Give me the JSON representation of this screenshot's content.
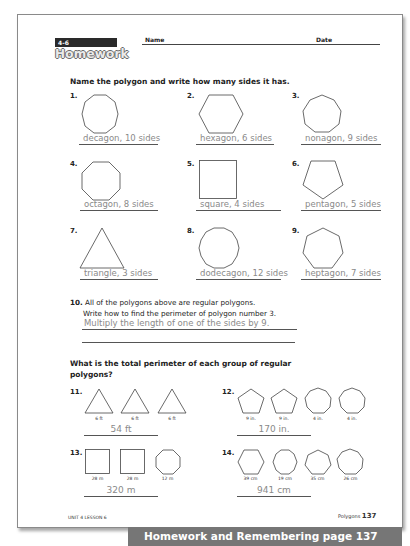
{
  "header": {
    "lesson_number": "4-6",
    "title": "Homework",
    "name_label": "Name",
    "date_label": "Date"
  },
  "instructions": "Name the polygon and write how many sides it has.",
  "polygons": [
    {
      "number": "1.",
      "shape": "decagon",
      "answer": "decagon, 10 sides"
    },
    {
      "number": "2.",
      "shape": "hexagon",
      "answer": "hexagon, 6 sides"
    },
    {
      "number": "3.",
      "shape": "nonagon",
      "answer": "nonagon, 9 sides"
    },
    {
      "number": "4.",
      "shape": "octagon",
      "answer": "octagon, 8 sides"
    },
    {
      "number": "5.",
      "shape": "square",
      "answer": "square, 4 sides"
    },
    {
      "number": "6.",
      "shape": "pentagon",
      "answer": "pentagon, 5 sides"
    },
    {
      "number": "7.",
      "shape": "triangle",
      "answer": "triangle, 3 sides"
    },
    {
      "number": "8.",
      "shape": "dodecagon",
      "answer": "dodecagon, 12 sides"
    },
    {
      "number": "9.",
      "shape": "heptagon",
      "answer": "heptagon, 7 sides"
    }
  ],
  "q10": {
    "number": "10.",
    "line1": "All of the polygons above are regular polygons.",
    "line2": "Write how to find the perimeter of polygon number 3.",
    "answer": "Multiply the length of one of the sides by 9."
  },
  "perimeter_instructions": "What is the total perimeter of each group of regular polygons?",
  "perimeter_groups": [
    {
      "number": "11.",
      "shapes": [
        {
          "shape": "triangle",
          "side": "6 ft"
        },
        {
          "shape": "triangle",
          "side": "6 ft"
        },
        {
          "shape": "triangle",
          "side": "6 ft"
        }
      ],
      "answer": "54 ft"
    },
    {
      "number": "12.",
      "shapes": [
        {
          "shape": "pentagon",
          "side": "9 in."
        },
        {
          "shape": "pentagon",
          "side": "9 in."
        },
        {
          "shape": "nonagon",
          "side": "4 in."
        },
        {
          "shape": "nonagon",
          "side": "4 in."
        }
      ],
      "answer": "170 in."
    },
    {
      "number": "13.",
      "shapes": [
        {
          "shape": "square",
          "side": "28 m"
        },
        {
          "shape": "square",
          "side": "28 m"
        },
        {
          "shape": "octagon",
          "side": "12 m"
        }
      ],
      "answer": "320 m"
    },
    {
      "number": "14.",
      "shapes": [
        {
          "shape": "hexagon",
          "side": "39 cm"
        },
        {
          "shape": "decagon",
          "side": "19 cm"
        },
        {
          "shape": "heptagon",
          "side": "35 cm"
        },
        {
          "shape": "nonagon",
          "side": "26 cm"
        }
      ],
      "answer": "941 cm"
    }
  ],
  "footer": {
    "left": "UNIT 4 LESSON 6",
    "right_label": "Polygons",
    "page_number": "137"
  },
  "banner": "Homework and Remembering page 137"
}
